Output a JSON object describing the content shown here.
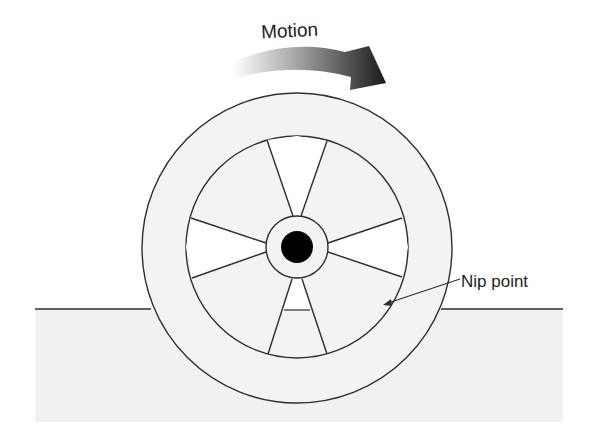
{
  "diagram": {
    "title_label": "Motion",
    "callout_label": "Nip point",
    "parts": {
      "outer_ring": "tire",
      "inner_ring": "wheel rim",
      "hub": "hub",
      "axle": "axle",
      "spokes": 6,
      "ground": "ground surface"
    },
    "colors": {
      "line": "#2e2e2e",
      "wheel_fill": "#f3f3f3",
      "ground_fill": "#f1f1f1",
      "wedge_fill": "#ffffff",
      "axle_fill": "#000000",
      "arrow_dark": "#1a1a1a",
      "arrow_light": "#ffffff"
    }
  }
}
